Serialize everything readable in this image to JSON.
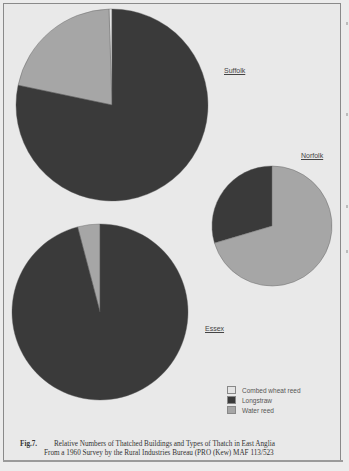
{
  "chart_data": [
    {
      "type": "pie",
      "title": "Suffolk",
      "start": "12 o'clock, counter-clockwise",
      "slices": [
        {
          "name": "Combed wheat reed",
          "value": 0.5
        },
        {
          "name": "Water reed",
          "value": 21.2
        },
        {
          "name": "Longstraw",
          "value": 78.3
        }
      ]
    },
    {
      "type": "pie",
      "title": "Norfolk",
      "start": "12 o'clock, counter-clockwise",
      "slices": [
        {
          "name": "Combed wheat reed",
          "value": 0
        },
        {
          "name": "Longstraw",
          "value": 29.6
        },
        {
          "name": "Water reed",
          "value": 70.4
        }
      ]
    },
    {
      "type": "pie",
      "title": "Essex",
      "start": "12 o'clock, counter-clockwise",
      "slices": [
        {
          "name": "Combed wheat reed",
          "value": 0
        },
        {
          "name": "Water reed",
          "value": 4.1
        },
        {
          "name": "Longstraw",
          "value": 95.9
        }
      ]
    }
  ],
  "legend": {
    "items": [
      {
        "label": "Combed wheat reed",
        "color": "#e4e4e4"
      },
      {
        "label": "Longstraw",
        "color": "#3a3a3a"
      },
      {
        "label": "Water reed",
        "color": "#a6a6a6"
      }
    ]
  },
  "colors": {
    "Combed wheat reed": "#e4e4e4",
    "Longstraw": "#3a3a3a",
    "Water reed": "#a6a6a6"
  },
  "caption": {
    "fig": "Fig.7.",
    "line1": "Relative Numbers of Thatched Buildings and Types of Thatch in East Anglia",
    "line2": "From a 1960 Survey by the Rural Industries Bureau (PRO (Kew) MAF 113/523"
  }
}
